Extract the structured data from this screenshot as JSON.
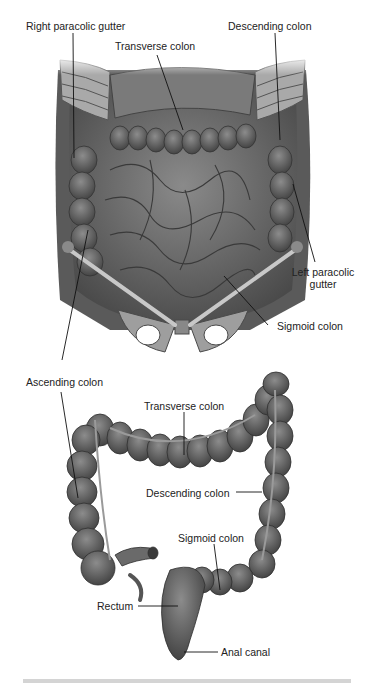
{
  "figure": {
    "top_panel": {
      "name": "Abdominal cavity, anterior view",
      "labels": {
        "right_paracolic_gutter": "Right paracolic gutter",
        "transverse_colon": "Transverse colon",
        "descending_colon": "Descending colon",
        "left_paracolic_gutter_line1": "Left paracolic",
        "left_paracolic_gutter_line2": "gutter",
        "sigmoid_colon": "Sigmoid colon"
      }
    },
    "bottom_panel": {
      "name": "Large intestine, isolated",
      "labels": {
        "ascending_colon": "Ascending colon",
        "transverse_colon": "Transverse colon",
        "descending_colon": "Descending colon",
        "sigmoid_colon": "Sigmoid colon",
        "rectum": "Rectum",
        "anal_canal": "Anal canal"
      }
    },
    "colors": {
      "tissue_dark": "#4a4a4a",
      "tissue_mid": "#6e6e6e",
      "tissue_light": "#9a9a9a",
      "bone": "#bdbdbd",
      "leader_line": "#111111",
      "background": "#ffffff"
    }
  }
}
